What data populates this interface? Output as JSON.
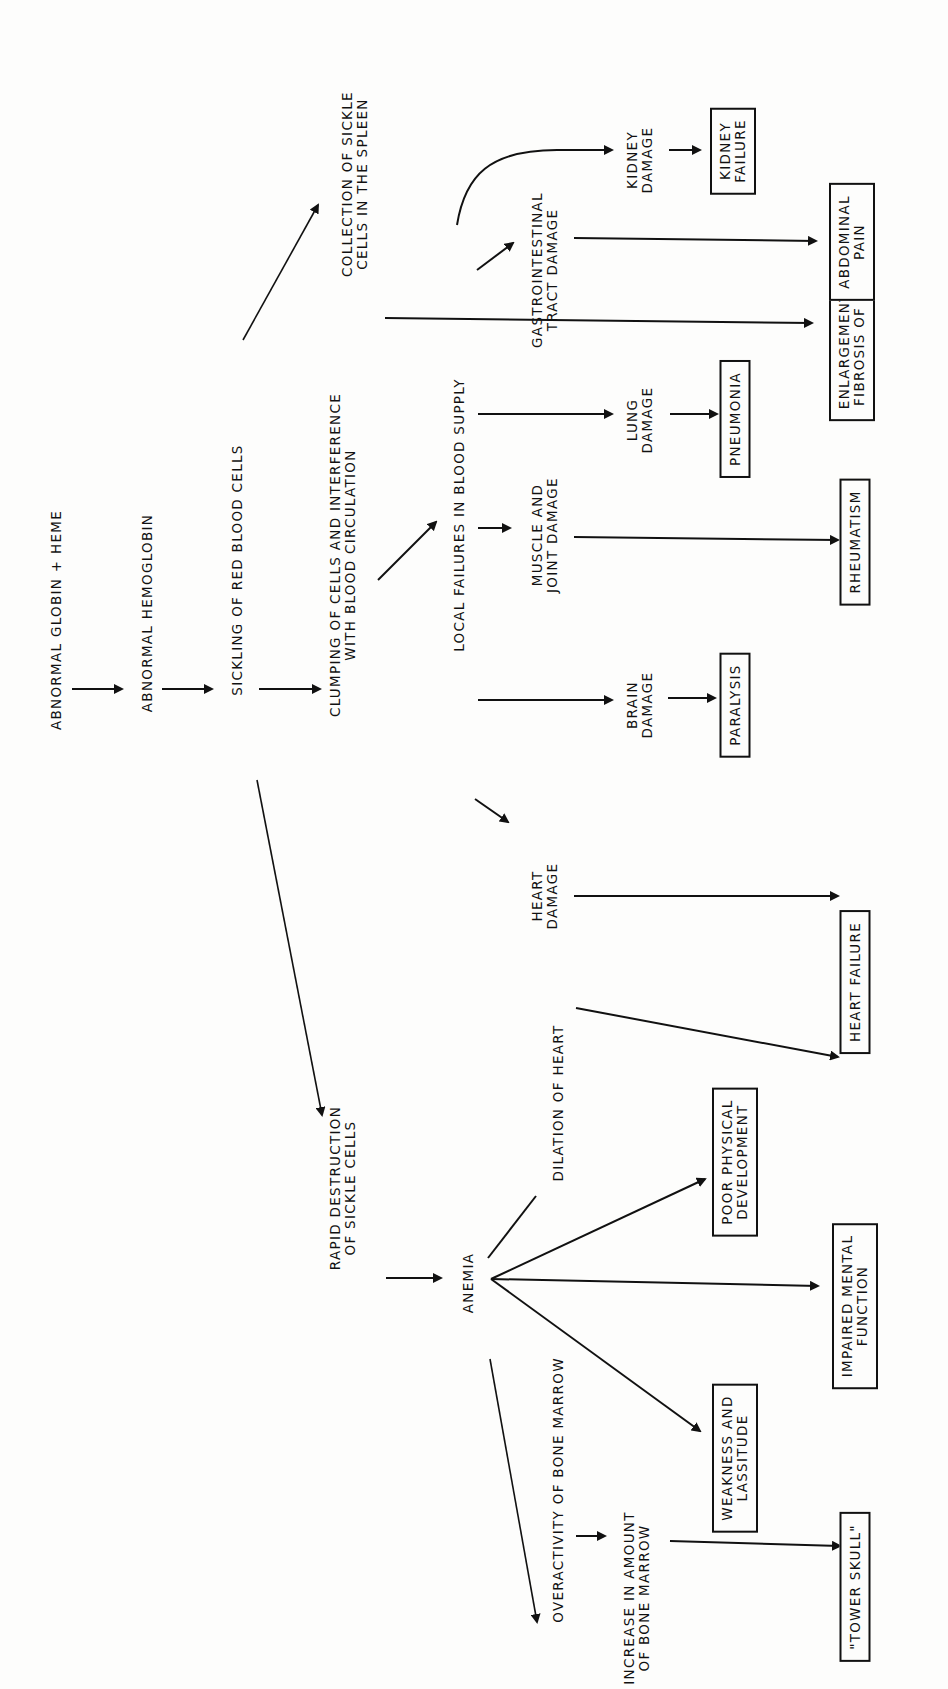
{
  "diagram": {
    "orientation": "rotated 90deg counter-clockwise (text reads bottom-to-top)",
    "nodes": {
      "abnormal_globin": "ABNORMAL GLOBIN + HEME",
      "abnormal_hemoglobin": "ABNORMAL HEMOGLOBIN",
      "sickling": "SICKLING OF RED BLOOD CELLS",
      "clumping": "CLUMPING OF CELLS AND INTERFERENCE\nWITH BLOOD CIRCULATION",
      "collection_spleen": "COLLECTION OF SICKLE\nCELLS IN THE SPLEEN",
      "rapid_destruction": "RAPID DESTRUCTION\nOF SICKLE CELLS",
      "local_failures": "LOCAL FAILURES IN BLOOD SUPPLY",
      "heart_damage": "HEART\nDAMAGE",
      "brain_damage": "BRAIN\nDAMAGE",
      "muscle_joint_damage": "MUSCLE AND\nJOINT DAMAGE",
      "lung_damage": "LUNG\nDAMAGE",
      "gi_damage": "GASTROINTESTINAL\nTRACT DAMAGE",
      "kidney_damage": "KIDNEY\nDAMAGE",
      "anemia": "ANEMIA",
      "dilation_heart": "DILATION OF HEART",
      "overactivity_marrow": "OVERACTIVITY OF BONE MARROW",
      "increase_marrow": "INCREASE IN AMOUNT\nOF BONE MARROW"
    },
    "outcome_boxes": {
      "spleen": "ENLARGEMENT, THEN\nFIBROSIS OF SPLEEN",
      "kidney_failure": "KIDNEY\nFAILURE",
      "abdominal_pain": "ABDOMINAL\nPAIN",
      "pneumonia": "PNEUMONIA",
      "rheumatism": "RHEUMATISM",
      "paralysis": "PARALYSIS",
      "heart_failure": "HEART FAILURE",
      "poor_physical": "POOR PHYSICAL\nDEVELOPMENT",
      "impaired_mental": "IMPAIRED MENTAL\nFUNCTION",
      "weakness": "WEAKNESS AND\nLASSITUDE",
      "tower_skull": "\"TOWER SKULL\""
    },
    "edges": [
      [
        "abnormal_globin",
        "abnormal_hemoglobin"
      ],
      [
        "abnormal_hemoglobin",
        "sickling"
      ],
      [
        "sickling",
        "clumping"
      ],
      [
        "sickling",
        "collection_spleen"
      ],
      [
        "sickling",
        "rapid_destruction"
      ],
      [
        "collection_spleen",
        "spleen"
      ],
      [
        "clumping",
        "local_failures"
      ],
      [
        "local_failures",
        "heart_damage"
      ],
      [
        "local_failures",
        "brain_damage"
      ],
      [
        "local_failures",
        "muscle_joint_damage"
      ],
      [
        "local_failures",
        "lung_damage"
      ],
      [
        "local_failures",
        "gi_damage"
      ],
      [
        "local_failures",
        "kidney_damage"
      ],
      [
        "heart_damage",
        "heart_failure"
      ],
      [
        "brain_damage",
        "paralysis"
      ],
      [
        "muscle_joint_damage",
        "rheumatism"
      ],
      [
        "lung_damage",
        "pneumonia"
      ],
      [
        "gi_damage",
        "abdominal_pain"
      ],
      [
        "kidney_damage",
        "kidney_failure"
      ],
      [
        "rapid_destruction",
        "anemia"
      ],
      [
        "anemia",
        "dilation_heart"
      ],
      [
        "dilation_heart",
        "heart_failure"
      ],
      [
        "anemia",
        "poor_physical"
      ],
      [
        "anemia",
        "impaired_mental"
      ],
      [
        "anemia",
        "weakness"
      ],
      [
        "anemia",
        "overactivity_marrow"
      ],
      [
        "overactivity_marrow",
        "increase_marrow"
      ],
      [
        "increase_marrow",
        "tower_skull"
      ]
    ]
  },
  "colors": {
    "ink": "#111111",
    "paper": "#fdfdfc"
  }
}
